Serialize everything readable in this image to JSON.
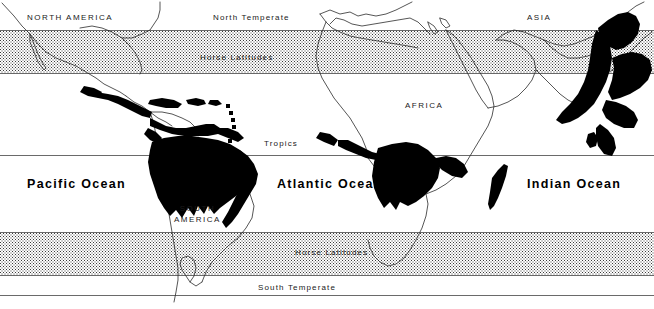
{
  "figure": {
    "kind": "world-distribution-map",
    "width": 654,
    "height": 309,
    "background_color": "#ffffff",
    "line_color": "#2b2b2b",
    "range_fill_color": "#000000",
    "stipple_color": "#3a3a3a"
  },
  "climate_zones": [
    {
      "id": "north-temperate",
      "label": "North Temperate",
      "style": "plain",
      "top": 14,
      "left": 213
    },
    {
      "id": "horse-north",
      "label": "Horse Latitudes",
      "style": "stipple",
      "top": 54,
      "left": 200
    },
    {
      "id": "tropics",
      "label": "Tropics",
      "style": "plain",
      "top": 140,
      "left": 264
    },
    {
      "id": "horse-south",
      "label": "Horse Latitudes",
      "style": "stipple",
      "top": 249,
      "left": 295
    },
    {
      "id": "south-temperate",
      "label": "South Temperate",
      "style": "plain",
      "top": 284,
      "left": 258
    }
  ],
  "bands": [
    {
      "id": "band-north-horse",
      "label": "Horse Latitudes",
      "top": 30,
      "height": 42
    },
    {
      "id": "band-south-horse",
      "label": "Horse Latitudes",
      "top": 232,
      "height": 42
    }
  ],
  "latitude_lines": [
    {
      "id": "line-tropics",
      "label": "Tropics",
      "top": 155
    },
    {
      "id": "line-south-temperate",
      "label": "South Temperate",
      "top": 295
    }
  ],
  "continents": [
    {
      "id": "north-america",
      "label": "NORTH AMERICA",
      "left": 27,
      "top": 12
    },
    {
      "id": "asia",
      "label": "ASIA",
      "left": 527,
      "top": 12
    },
    {
      "id": "africa",
      "label": "AFRICA",
      "left": 405,
      "top": 100
    },
    {
      "id": "south-america",
      "label_line1": "SOUTH",
      "label_line2": "AMERICA",
      "left": 174,
      "top": 203
    }
  ],
  "oceans": [
    {
      "id": "pacific",
      "label": "Pacific Ocean",
      "left": 27,
      "top": 178
    },
    {
      "id": "atlantic",
      "label": "Atlantic Ocean",
      "left": 277,
      "top": 178
    },
    {
      "id": "indian",
      "label": "Indian Ocean",
      "left": 527,
      "top": 178
    }
  ]
}
